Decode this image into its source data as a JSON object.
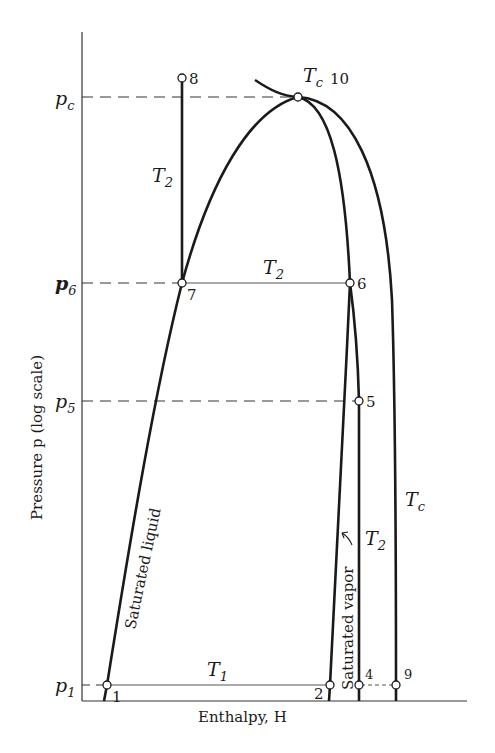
{
  "diagram": {
    "type": "pressure-enthalpy diagram",
    "axes": {
      "y_label": "Pressure p (log scale)",
      "x_label": "Enthalpy, H"
    },
    "pressure_levels": [
      {
        "id": "pc",
        "label": "p",
        "sub": "c"
      },
      {
        "id": "p6",
        "label": "p",
        "sub": "6"
      },
      {
        "id": "p5",
        "label": "p",
        "sub": "5"
      },
      {
        "id": "p1",
        "label": "p",
        "sub": "1"
      }
    ],
    "points": [
      {
        "id": "1",
        "label": "1"
      },
      {
        "id": "2",
        "label": "2"
      },
      {
        "id": "4",
        "label": "4"
      },
      {
        "id": "5",
        "label": "5"
      },
      {
        "id": "6",
        "label": "6"
      },
      {
        "id": "7",
        "label": "7"
      },
      {
        "id": "8",
        "label": "8"
      },
      {
        "id": "9",
        "label": "9"
      },
      {
        "id": "10",
        "label": "10"
      }
    ],
    "curve_labels": {
      "saturated_liquid": "Saturated liquid",
      "saturated_vapor": "Saturated vapor",
      "tc_top": {
        "main": "T",
        "sub": "c"
      },
      "tc_right": {
        "main": "T",
        "sub": "c"
      },
      "t2_vertical": {
        "main": "T",
        "sub": "2"
      },
      "t2_horizontal": {
        "main": "T",
        "sub": "2"
      },
      "t2_right": {
        "main": "T",
        "sub": "2"
      },
      "t1_horizontal": {
        "main": "T",
        "sub": "1"
      }
    }
  }
}
